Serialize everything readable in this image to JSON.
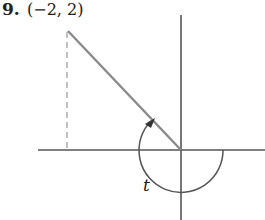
{
  "problem": {
    "number": "9.",
    "point_label": "(−2, 2)",
    "angle_label": "t"
  },
  "diagram": {
    "point": {
      "x": -2,
      "y": 2
    },
    "elements": [
      "x-axis",
      "y-axis",
      "terminal-side",
      "dashed-perpendicular",
      "angle-arc-with-arrow"
    ],
    "colors": {
      "axes": "#555555",
      "terminal_side": "#888888",
      "arc": "#555555",
      "dashed_line": "#999999"
    }
  }
}
